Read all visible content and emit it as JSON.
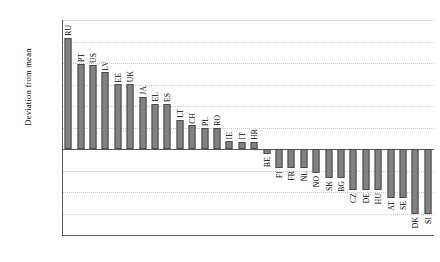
{
  "chart_data": {
    "type": "bar",
    "title": "",
    "xlabel": "",
    "ylabel": "Deviation from mean",
    "ylim": [
      -2.0,
      3.0
    ],
    "ytick_step": 0.5,
    "ytick_labels": [
      "3.00",
      "2.50",
      "2.00",
      "1.50",
      "1.00",
      "0.50",
      "0.00",
      "-0.50",
      "-1.00",
      "-1.50",
      "-2.00"
    ],
    "ytick_values": [
      3.0,
      2.5,
      2.0,
      1.5,
      1.0,
      0.5,
      0.0,
      -0.5,
      -1.0,
      -1.5,
      -2.0
    ],
    "grid": true,
    "legend": "none",
    "orientation": "vertical",
    "bar_color": "#828282",
    "bar_edge_color": "#4a4a4a",
    "axis_color": "#5a5a5a",
    "grid_color": "#c9c9c9",
    "categories": [
      "RU",
      "PT",
      "US",
      "LV",
      "EE",
      "UK",
      "JA",
      "EL",
      "ES",
      "LT",
      "CH",
      "PL",
      "RO",
      "IE",
      "IT",
      "HR",
      "BE",
      "FI",
      "FR",
      "NL",
      "NO",
      "SK",
      "BG",
      "CZ",
      "DE",
      "HU",
      "AT",
      "SE",
      "DK",
      "SI"
    ],
    "values": [
      2.58,
      1.97,
      1.95,
      1.78,
      1.51,
      1.51,
      1.21,
      1.05,
      1.05,
      0.68,
      0.55,
      0.48,
      0.5,
      0.18,
      0.17,
      0.16,
      -0.12,
      -0.45,
      -0.45,
      -0.45,
      -0.55,
      -0.68,
      -0.68,
      -0.95,
      -0.95,
      -0.95,
      -1.15,
      -1.15,
      -1.5,
      -1.5
    ]
  }
}
